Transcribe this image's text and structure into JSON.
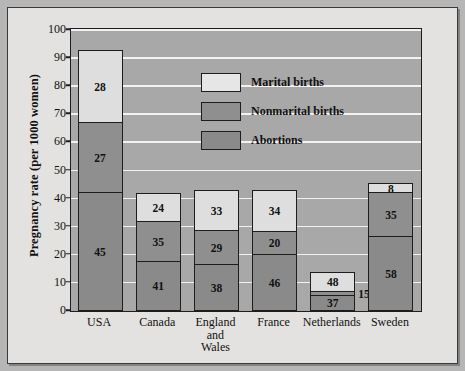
{
  "chart_data": {
    "type": "bar",
    "subtype": "stacked-bar-percentage",
    "title": "",
    "xlabel": "",
    "ylabel": "Pregnancy rate (per 1000 women)",
    "ylim": [
      0,
      100
    ],
    "yticks": [
      0,
      10,
      20,
      30,
      40,
      50,
      60,
      70,
      80,
      90,
      100
    ],
    "grid": true,
    "legend_position": "inside-top-center",
    "categories": [
      "USA",
      "Canada",
      "England and Wales",
      "France",
      "Netherlands",
      "Sweden"
    ],
    "totals": [
      94,
      43,
      44,
      44,
      15,
      46
    ],
    "series": [
      {
        "name": "Marital births",
        "values": [
          28,
          24,
          33,
          34,
          48,
          8
        ],
        "color": "#dedede",
        "unit": "percent of total"
      },
      {
        "name": "Nonmarital births",
        "values": [
          27,
          35,
          29,
          20,
          15,
          35
        ],
        "color": "#8f8f8f",
        "unit": "percent of total"
      },
      {
        "name": "Abortions",
        "values": [
          45,
          41,
          38,
          46,
          37,
          58
        ],
        "color": "#8a8a8a",
        "unit": "percent of total"
      }
    ],
    "annotations": [
      {
        "category": "Netherlands",
        "series": "Nonmarital births",
        "text": "15",
        "placement": "outside-right"
      }
    ]
  },
  "axis": {
    "y_title": "Pregnancy rate (per 1000 women)",
    "y_ticks": [
      "100",
      "90",
      "80",
      "70",
      "60",
      "50",
      "40",
      "30",
      "20",
      "10",
      "0"
    ]
  },
  "legend": {
    "items": [
      {
        "label": "Marital births",
        "key": "marital"
      },
      {
        "label": "Nonmarital births",
        "key": "nonmarital"
      },
      {
        "label": "Abortions",
        "key": "abortion"
      }
    ]
  },
  "bars": [
    {
      "name": "USA",
      "label_lines": [
        "USA"
      ],
      "total": 94,
      "segments": [
        {
          "key": "marital",
          "label": "28",
          "share": 28
        },
        {
          "key": "nonmarital",
          "label": "27",
          "share": 27
        },
        {
          "key": "abortion",
          "label": "45",
          "share": 45
        }
      ]
    },
    {
      "name": "Canada",
      "label_lines": [
        "Canada"
      ],
      "total": 43,
      "segments": [
        {
          "key": "marital",
          "label": "24",
          "share": 24
        },
        {
          "key": "nonmarital",
          "label": "35",
          "share": 35
        },
        {
          "key": "abortion",
          "label": "41",
          "share": 41
        }
      ]
    },
    {
      "name": "England and Wales",
      "label_lines": [
        "England",
        "and",
        "Wales"
      ],
      "total": 44,
      "segments": [
        {
          "key": "marital",
          "label": "33",
          "share": 33
        },
        {
          "key": "nonmarital",
          "label": "29",
          "share": 29
        },
        {
          "key": "abortion",
          "label": "38",
          "share": 38
        }
      ]
    },
    {
      "name": "France",
      "label_lines": [
        "France"
      ],
      "total": 44,
      "segments": [
        {
          "key": "marital",
          "label": "34",
          "share": 34
        },
        {
          "key": "nonmarital",
          "label": "20",
          "share": 20
        },
        {
          "key": "abortion",
          "label": "46",
          "share": 46
        }
      ]
    },
    {
      "name": "Netherlands",
      "label_lines": [
        "Netherlands"
      ],
      "total": 15,
      "segments": [
        {
          "key": "marital",
          "label": "48",
          "share": 48
        },
        {
          "key": "nonmarital",
          "label": "15",
          "share": 15,
          "outside": true
        },
        {
          "key": "abortion",
          "label": "37",
          "share": 37
        }
      ]
    },
    {
      "name": "Sweden",
      "label_lines": [
        "Sweden"
      ],
      "total": 46,
      "segments": [
        {
          "key": "marital",
          "label": "8",
          "share": 8
        },
        {
          "key": "nonmarital",
          "label": "35",
          "share": 35
        },
        {
          "key": "abortion",
          "label": "58",
          "share": 58
        }
      ]
    }
  ]
}
